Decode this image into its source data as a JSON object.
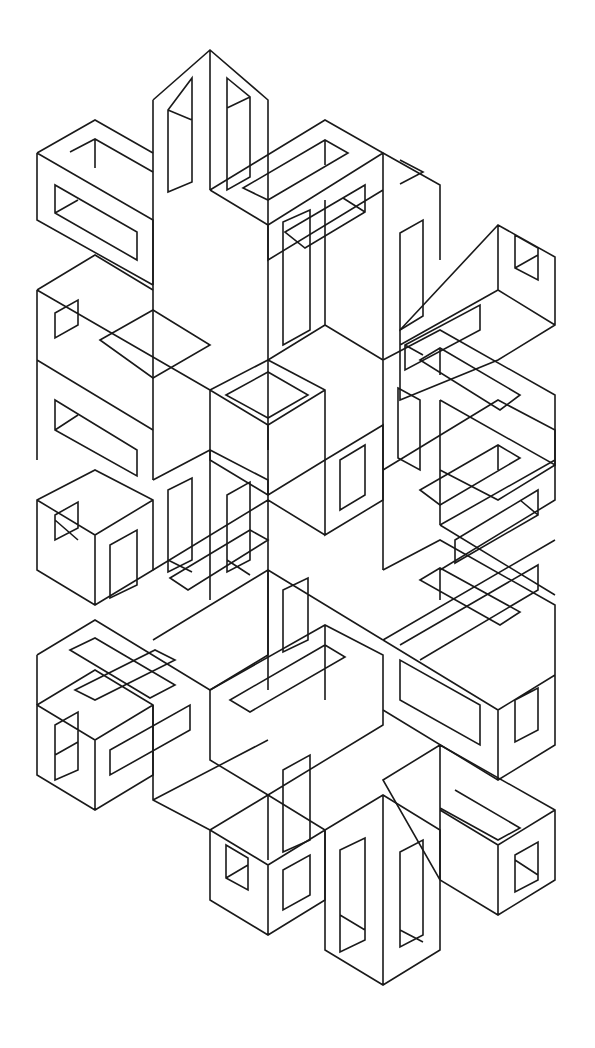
{
  "figure": {
    "background": "#ffffff",
    "stroke": "#1a1a1a",
    "grid": {
      "columns_x": [
        37,
        95,
        153,
        210,
        268,
        325,
        383,
        440,
        498,
        555
      ],
      "slope": 0.5
    }
  },
  "shapes": [
    {
      "name": "top-vertical-pillar-outer",
      "d": "M153 100 L210 50 L268 100 L268 450 M153 100 L153 480 M210 50 L210 190"
    },
    {
      "name": "top-vertical-pillar-slots",
      "d": "M168 110 L192 78 L192 182 L168 192 Z M227 78 L250 97 L250 177 L227 190 Z M168 110 L192 120 M227 108 L250 97"
    },
    {
      "name": "top-left-frame",
      "d": "M37 153 L95 120 L153 153 M37 153 L37 220 L153 285 M37 153 L153 220 L153 285 M70 152 L95 139 L153 172 M95 139 L95 168 M55 185 L55 213 L137 260 L137 232 Z M55 213 L78 200"
    },
    {
      "name": "top-center-frame",
      "d": "M210 190 L325 120 L383 153 L383 220 M210 190 L268 225 L383 153 M243 188 L325 140 L348 153 L268 200 Z M325 140 L325 165 M268 225 L268 260 L383 190 M285 232 L365 185 L365 212 L305 248 Z M343 198 L365 212"
    },
    {
      "name": "top-right-column",
      "d": "M383 153 L440 185 L440 260 M383 220 L383 360 M400 233 L423 220 L423 316 L400 330 Z M400 160 L423 172 L400 184"
    },
    {
      "name": "right-upper-frame",
      "d": "M400 330 L498 225 L555 257 L555 325 L498 360 L400 400 Z M498 225 L498 290 L555 325 M498 290 L400 345 M515 235 L538 248 L538 280 L515 268 Z M515 268 L538 255 M405 345 L480 305 L480 330 L405 370 Z M405 345 L423 355"
    },
    {
      "name": "right-middle-frame",
      "d": "M383 360 L440 330 L555 395 L555 465 L440 400 M420 360 L440 348 L520 395 L500 410 Z M440 348 L440 375 M383 360 L383 570 M440 400 L440 525 M398 388 L420 400 L420 470 L398 458 Z M555 465 L498 500 L440 470"
    },
    {
      "name": "right-lower-frame",
      "d": "M383 470 L498 400 L555 430 L555 500 L440 570 M420 490 L498 445 L520 458 L440 505 Z M498 445 L498 470 M440 525 L555 460 M455 540 L538 490 L538 515 L455 563 Z M520 500 L538 515"
    },
    {
      "name": "left-middle-frame",
      "d": "M37 290 L95 255 L153 290 M37 290 L37 460 M37 360 L153 430 M37 290 L210 390 M55 313 L78 300 L78 325 L55 338 Z M55 400 L55 430 L137 476 L137 450 Z M55 430 L78 415 M100 340 L153 310 L210 345 L153 378 Z"
    },
    {
      "name": "center-tall-frame",
      "d": "M153 480 L210 450 L268 480 L268 690 M210 450 L210 600 M168 490 L192 478 L192 560 L168 572 Z M227 495 L250 482 L250 560 L227 572 Z M227 560 L250 575 M168 560 L192 572"
    },
    {
      "name": "center-hub",
      "d": "M210 390 L268 360 L325 390 L325 460 L268 495 L210 460 Z M210 390 L268 425 L325 390 M268 425 L268 495 M226 395 L268 372 L308 395 L268 418 Z"
    },
    {
      "name": "center-right-hub",
      "d": "M268 360 L325 325 L383 360 M325 325 L325 200 M283 345 L310 330 L310 210 L283 222 Z M325 460 L383 425 L383 500 L325 535 Z M340 460 L365 445 L365 495 L340 510 Z"
    },
    {
      "name": "left-lower-frame",
      "d": "M37 500 L95 470 L153 500 L153 570 L95 605 L37 570 Z M37 500 L95 535 L153 500 M95 535 L95 605 M55 515 L78 502 L78 528 L55 540 Z M55 520 L78 540 M110 545 L137 530 L137 585 L110 598 Z"
    },
    {
      "name": "left-bottom-frame",
      "d": "M37 705 L95 670 L153 705 L153 775 L95 810 L37 775 Z M37 705 L95 740 L153 705 M95 740 L95 810 M55 725 L78 712 L78 770 L55 780 Z M55 755 L78 742 M110 750 L190 705 L190 730 L110 775 Z M75 690 L155 650 L175 660 L95 700 Z"
    },
    {
      "name": "left-bottom-connector",
      "d": "M37 655 L95 620 L210 690 L268 655 M37 655 L37 705 M70 650 L95 638 L175 685 L150 698 Z M153 705 L153 800 L210 830 M153 800 L268 740"
    },
    {
      "name": "center-lower-frame",
      "d": "M210 690 L325 625 L383 655 L383 725 L268 795 L210 760 Z M230 700 L325 645 L345 657 L250 712 Z M268 795 L268 860 M283 770 L310 755 L310 840 L283 852 Z M325 625 L325 700"
    },
    {
      "name": "bottom-center-cube",
      "d": "M210 830 L268 795 L325 830 L325 900 L268 935 L210 900 Z M210 830 L268 865 L325 830 M268 865 L268 935 M226 845 L248 858 L248 890 L226 878 Z M226 878 L248 865 M283 870 L310 855 L310 895 L283 910 Z"
    },
    {
      "name": "bottom-right-pillar",
      "d": "M325 830 L383 795 L440 830 L440 950 L383 985 L325 950 Z M383 795 L383 985 M340 850 L365 838 L365 940 L340 952 Z M400 852 L423 840 L423 935 L400 947 Z M340 915 L365 930 M400 930 L423 942"
    },
    {
      "name": "bottom-right-cube",
      "d": "M383 780 L440 745 L555 810 L555 880 L498 915 L440 880 Z M440 745 L440 880 M498 845 L498 915 M440 810 L498 845 L555 810 M515 855 L538 842 L538 880 L515 892 Z M515 860 L538 875 M455 790 L520 828 L498 840 L440 808"
    },
    {
      "name": "lower-right-frame",
      "d": "M383 570 L440 540 L555 605 L555 745 L498 780 L383 710 M420 580 L440 568 L520 612 L500 625 Z M440 568 L440 600 M383 640 L498 710 L555 675 M400 660 L400 700 L480 745 L480 705 Z M498 710 L498 780 M515 700 L538 688 L538 730 L515 742 Z"
    },
    {
      "name": "right-lower-crossbar",
      "d": "M383 640 L555 540 M400 645 L538 565 L538 590 L420 660 M440 525 L555 595"
    },
    {
      "name": "middle-crossbars",
      "d": "M153 570 L268 500 L325 535 M153 640 L268 570 L383 640 M170 578 L250 530 L268 540 L188 590 Z M268 570 L268 655 M283 590 L308 578 L308 640 L283 652 Z"
    }
  ]
}
